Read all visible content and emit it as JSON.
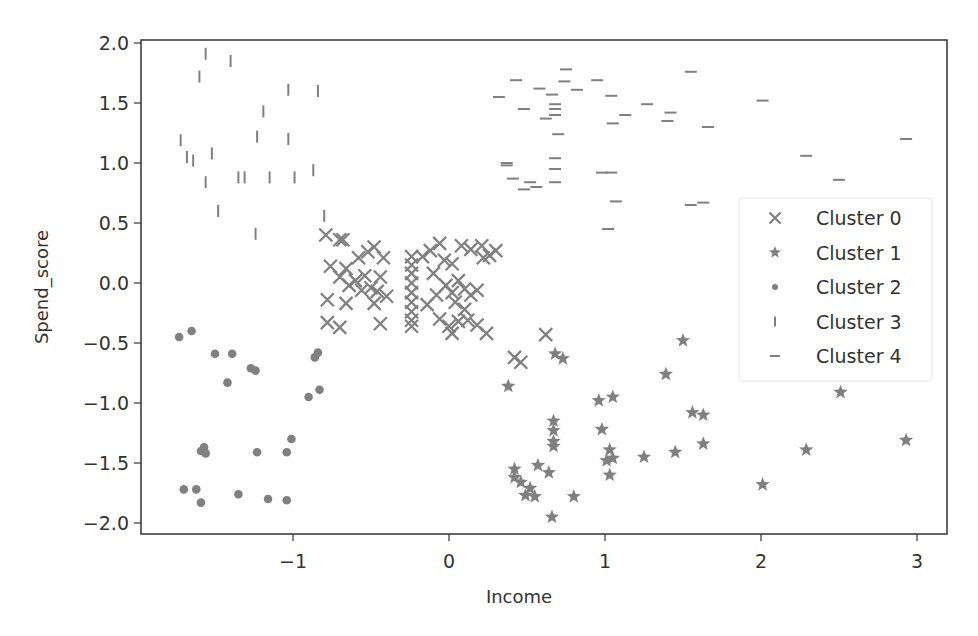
{
  "chart_data": {
    "type": "scatter",
    "title": "",
    "xlabel": "Income",
    "ylabel": "Spend_score",
    "xlim": [
      -1.97,
      3.19
    ],
    "ylim": [
      -2.09,
      2.02
    ],
    "xticks": [
      -1,
      0,
      1,
      2,
      3
    ],
    "xtick_labels": [
      "−1",
      "0",
      "1",
      "2",
      "3"
    ],
    "yticks": [
      -2.0,
      -1.5,
      -1.0,
      -0.5,
      0.0,
      0.5,
      1.0,
      1.5,
      2.0
    ],
    "ytick_labels": [
      "−2.0",
      "−1.5",
      "−1.0",
      "−0.5",
      "0.0",
      "0.5",
      "1.0",
      "1.5",
      "2.0"
    ],
    "grid": false,
    "legend_position": "center right",
    "marker_color": "#808080",
    "series": [
      {
        "name": "Cluster 0",
        "marker": "x",
        "points": [
          [
            -0.79,
            0.4
          ],
          [
            -0.7,
            0.36
          ],
          [
            -0.68,
            0.36
          ],
          [
            -0.76,
            0.14
          ],
          [
            -0.66,
            0.12
          ],
          [
            -0.58,
            0.21
          ],
          [
            -0.52,
            0.26
          ],
          [
            -0.48,
            0.3
          ],
          [
            -0.42,
            0.21
          ],
          [
            -0.6,
            0.02
          ],
          [
            -0.54,
            0.06
          ],
          [
            -0.44,
            0.05
          ],
          [
            -0.7,
            0.05
          ],
          [
            -0.64,
            -0.02
          ],
          [
            -0.78,
            -0.14
          ],
          [
            -0.56,
            -0.06
          ],
          [
            -0.5,
            -0.04
          ],
          [
            -0.46,
            -0.07
          ],
          [
            -0.4,
            -0.11
          ],
          [
            -0.66,
            -0.17
          ],
          [
            -0.48,
            -0.17
          ],
          [
            -0.78,
            -0.33
          ],
          [
            -0.7,
            -0.37
          ],
          [
            -0.44,
            -0.34
          ],
          [
            -0.24,
            0.22
          ],
          [
            -0.24,
            0.15
          ],
          [
            -0.24,
            0.08
          ],
          [
            -0.24,
            0.0
          ],
          [
            -0.24,
            -0.08
          ],
          [
            -0.24,
            -0.16
          ],
          [
            -0.24,
            -0.24
          ],
          [
            -0.24,
            -0.31
          ],
          [
            -0.24,
            -0.36
          ],
          [
            -0.17,
            0.22
          ],
          [
            -0.12,
            0.27
          ],
          [
            -0.06,
            0.33
          ],
          [
            -0.03,
            0.19
          ],
          [
            0.02,
            0.16
          ],
          [
            0.08,
            0.31
          ],
          [
            0.14,
            0.28
          ],
          [
            0.21,
            0.31
          ],
          [
            0.26,
            0.23
          ],
          [
            0.3,
            0.27
          ],
          [
            0.22,
            0.21
          ],
          [
            -0.1,
            0.08
          ],
          [
            -0.02,
            -0.02
          ],
          [
            0.02,
            -0.08
          ],
          [
            0.06,
            0.02
          ],
          [
            0.1,
            -0.05
          ],
          [
            0.14,
            -0.1
          ],
          [
            0.18,
            -0.06
          ],
          [
            -0.08,
            -0.1
          ],
          [
            0.04,
            -0.16
          ],
          [
            0.1,
            -0.22
          ],
          [
            -0.14,
            -0.18
          ],
          [
            -0.06,
            -0.3
          ],
          [
            0.0,
            -0.36
          ],
          [
            0.06,
            -0.32
          ],
          [
            0.12,
            -0.31
          ],
          [
            0.18,
            -0.35
          ],
          [
            0.24,
            -0.42
          ],
          [
            0.02,
            -0.42
          ],
          [
            0.62,
            -0.43
          ],
          [
            0.42,
            -0.62
          ],
          [
            0.46,
            -0.66
          ]
        ]
      },
      {
        "name": "Cluster 1",
        "marker": "star",
        "points": [
          [
            0.68,
            -0.59
          ],
          [
            0.73,
            -0.63
          ],
          [
            0.38,
            -0.86
          ],
          [
            0.96,
            -0.98
          ],
          [
            1.05,
            -0.95
          ],
          [
            0.98,
            -1.22
          ],
          [
            0.67,
            -1.15
          ],
          [
            0.67,
            -1.23
          ],
          [
            0.67,
            -1.32
          ],
          [
            0.67,
            -1.36
          ],
          [
            1.03,
            -1.39
          ],
          [
            1.05,
            -1.46
          ],
          [
            1.01,
            -1.48
          ],
          [
            1.03,
            -1.6
          ],
          [
            0.42,
            -1.55
          ],
          [
            0.42,
            -1.62
          ],
          [
            0.46,
            -1.66
          ],
          [
            0.57,
            -1.52
          ],
          [
            0.64,
            -1.58
          ],
          [
            0.49,
            -1.77
          ],
          [
            0.52,
            -1.71
          ],
          [
            0.55,
            -1.78
          ],
          [
            0.8,
            -1.78
          ],
          [
            0.66,
            -1.95
          ],
          [
            1.25,
            -1.45
          ],
          [
            1.45,
            -1.41
          ],
          [
            1.39,
            -0.76
          ],
          [
            1.5,
            -0.48
          ],
          [
            1.56,
            -1.08
          ],
          [
            1.63,
            -1.1
          ],
          [
            1.63,
            -1.34
          ],
          [
            2.01,
            -1.68
          ],
          [
            2.29,
            -1.39
          ],
          [
            2.51,
            -0.91
          ],
          [
            2.93,
            -1.31
          ]
        ]
      },
      {
        "name": "Cluster 2",
        "marker": "o",
        "points": [
          [
            -1.73,
            -0.45
          ],
          [
            -1.65,
            -0.4
          ],
          [
            -1.5,
            -0.59
          ],
          [
            -1.39,
            -0.59
          ],
          [
            -1.42,
            -0.83
          ],
          [
            -1.27,
            -0.71
          ],
          [
            -1.24,
            -0.73
          ],
          [
            -0.86,
            -0.62
          ],
          [
            -0.84,
            -0.58
          ],
          [
            -0.9,
            -0.95
          ],
          [
            -0.83,
            -0.89
          ],
          [
            -1.7,
            -1.72
          ],
          [
            -1.62,
            -1.72
          ],
          [
            -1.59,
            -1.83
          ],
          [
            -1.35,
            -1.76
          ],
          [
            -1.16,
            -1.8
          ],
          [
            -1.04,
            -1.81
          ],
          [
            -1.57,
            -1.37
          ],
          [
            -1.59,
            -1.4
          ],
          [
            -1.56,
            -1.42
          ],
          [
            -1.23,
            -1.41
          ],
          [
            -1.04,
            -1.41
          ],
          [
            -1.01,
            -1.3
          ]
        ]
      },
      {
        "name": "Cluster 3",
        "marker": "|",
        "points": [
          [
            -1.56,
            1.91
          ],
          [
            -1.4,
            1.85
          ],
          [
            -1.6,
            1.72
          ],
          [
            -1.03,
            1.61
          ],
          [
            -0.84,
            1.6
          ],
          [
            -1.19,
            1.43
          ],
          [
            -1.72,
            1.19
          ],
          [
            -1.23,
            1.22
          ],
          [
            -1.03,
            1.2
          ],
          [
            -1.68,
            1.05
          ],
          [
            -1.64,
            1.02
          ],
          [
            -1.52,
            1.08
          ],
          [
            -1.56,
            0.84
          ],
          [
            -1.35,
            0.88
          ],
          [
            -1.31,
            0.88
          ],
          [
            -1.15,
            0.88
          ],
          [
            -0.99,
            0.88
          ],
          [
            -0.87,
            0.94
          ],
          [
            -1.48,
            0.6
          ],
          [
            -1.24,
            0.41
          ],
          [
            -0.8,
            0.56
          ]
        ]
      },
      {
        "name": "Cluster 4",
        "marker": "_",
        "points": [
          [
            0.32,
            1.55
          ],
          [
            0.43,
            1.69
          ],
          [
            0.58,
            1.62
          ],
          [
            0.48,
            1.45
          ],
          [
            0.74,
            1.68
          ],
          [
            0.66,
            1.57
          ],
          [
            0.75,
            1.78
          ],
          [
            0.68,
            1.49
          ],
          [
            0.68,
            1.45
          ],
          [
            0.68,
            1.4
          ],
          [
            0.62,
            1.37
          ],
          [
            0.82,
            1.61
          ],
          [
            0.95,
            1.69
          ],
          [
            0.7,
            1.24
          ],
          [
            1.04,
            1.56
          ],
          [
            1.05,
            1.33
          ],
          [
            1.13,
            1.4
          ],
          [
            1.27,
            1.49
          ],
          [
            1.4,
            1.35
          ],
          [
            1.55,
            1.76
          ],
          [
            1.42,
            1.42
          ],
          [
            1.66,
            1.3
          ],
          [
            2.01,
            1.52
          ],
          [
            2.29,
            1.06
          ],
          [
            2.5,
            0.86
          ],
          [
            2.93,
            1.2
          ],
          [
            0.37,
            1.0
          ],
          [
            0.37,
            0.98
          ],
          [
            0.41,
            0.87
          ],
          [
            0.48,
            0.78
          ],
          [
            0.52,
            0.84
          ],
          [
            0.56,
            0.8
          ],
          [
            0.68,
            1.04
          ],
          [
            0.68,
            0.95
          ],
          [
            0.68,
            0.84
          ],
          [
            0.98,
            0.92
          ],
          [
            1.04,
            0.92
          ],
          [
            1.07,
            0.68
          ],
          [
            1.02,
            0.45
          ],
          [
            1.55,
            0.65
          ],
          [
            1.63,
            0.67
          ]
        ]
      }
    ]
  },
  "legend": {
    "items": [
      {
        "label": "Cluster 0",
        "marker": "x"
      },
      {
        "label": "Cluster 1",
        "marker": "star"
      },
      {
        "label": "Cluster 2",
        "marker": "o"
      },
      {
        "label": "Cluster 3",
        "marker": "|"
      },
      {
        "label": "Cluster 4",
        "marker": "_"
      }
    ]
  }
}
